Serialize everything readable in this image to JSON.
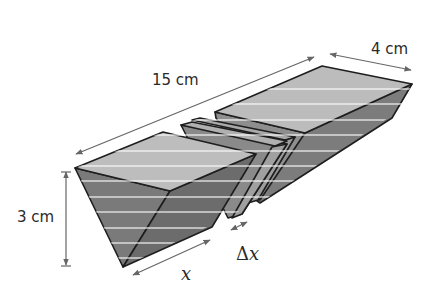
{
  "figure": {
    "colors": {
      "top_face": "#b8b8b8",
      "side_face": "#8a8a8a",
      "front_face": "#6e6e6e",
      "slab_top": "#a6a6a6",
      "slab_side": "#9a9a9a",
      "edge": "#1e1e1e",
      "dimension_line": "#666666"
    },
    "labels": {
      "length": "15 cm",
      "width": "4 cm",
      "height": "3 cm",
      "position": "x",
      "slice_thickness_delta": "Δ",
      "slice_thickness_var": "x"
    },
    "parts": [
      {
        "name": "left-block",
        "description": "front portion of prism, length x"
      },
      {
        "name": "slice-slab-1",
        "description": "thin slice of thickness Δx"
      },
      {
        "name": "slice-slab-2",
        "description": "adjacent thin slice"
      },
      {
        "name": "right-block",
        "description": "remaining back portion of prism"
      }
    ]
  }
}
